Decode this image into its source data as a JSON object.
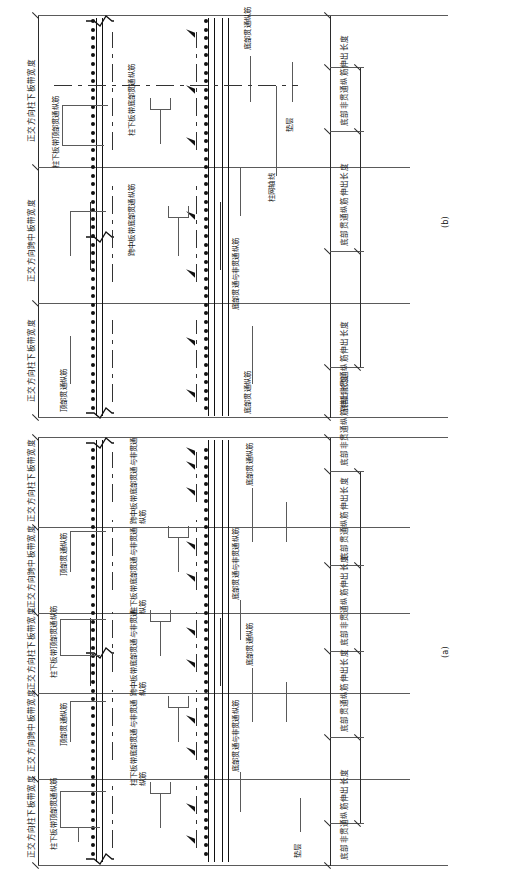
{
  "drawing": {
    "type": "structural-reinforcement-section",
    "discipline": "raft-foundation-slab-band-reinforcement",
    "orientation": "page-rotated-90-ccw",
    "figures": [
      {
        "id": "a",
        "tag": "(a)"
      },
      {
        "id": "b",
        "tag": "(b)"
      }
    ]
  },
  "labels": {
    "column_strip_width": "正交方向柱下板带宽度",
    "middle_strip_width": "正交方向跨中板带宽度",
    "column_strip_top_through_bars": "柱下板带顶部贯通纵筋",
    "column_strip_bottom_bars": "柱下板带底部贯通与非贯通纵筋",
    "middle_strip_bottom_bars": "跨中板带底部贯通与非贯通纵筋",
    "top_through_bars": "顶部贯通纵筋",
    "bottom_through_bars": "底部贯通纵筋",
    "bottom_through_and_non_through_bars": "底部贯通与非贯通纵筋",
    "bottom_non_through_extension_length": "底部非贯通纵筋伸出长度",
    "bottom_through_extension_length": "底部贯通纵筋伸出长度",
    "column_grid_axis": "柱网轴线",
    "cushion_layer": "垫层"
  },
  "figure_a": {
    "tag": "(a)",
    "dimension_chain_top": [
      "正交方向柱下板带宽度",
      "正交方向跨中板带宽度",
      "正交方向柱下板带宽度",
      "正交方向跨中板带宽度",
      "正交方向柱下板带宽度"
    ],
    "dimension_chain_bottom": [
      "底部非贯通纵筋伸出长度",
      "底部贯通纵筋伸出长度",
      "底部非贯通纵筋伸出长度",
      "底部贯通纵筋伸出长度",
      "底部非贯通纵筋伸出长度"
    ],
    "callouts": [
      "柱下板带顶部贯通纵筋",
      "柱下板带底部贯通与非贯通纵筋",
      "顶部贯通纵筋",
      "跨中板带底部贯通与非贯通纵筋",
      "底部贯通纵筋",
      "底部贯通与非贯通纵筋",
      "柱下板带顶部贯通纵筋",
      "柱下板带底部贯通与非贯通纵筋",
      "顶部贯通纵筋",
      "跨中板带底部贯通与非贯通纵筋",
      "底部贯通纵筋",
      "底部贯通与非贯通纵筋",
      "垫层"
    ]
  },
  "figure_b": {
    "tag": "(b)",
    "dimension_chain_top": [
      "正交方向柱下板带宽度",
      "正交方向跨中板带宽度",
      "正交方向柱下板带宽度"
    ],
    "dimension_chain_bottom": [
      "底部非贯通纵筋伸出长度",
      "底部贯通纵筋伸出长度",
      "底部非贯通纵筋伸出长度"
    ],
    "callouts": [
      "柱下板带顶部贯通纵筋",
      "柱下板带底部贯通纵筋",
      "顶部贯通纵筋",
      "跨中板带底部贯通纵筋",
      "底部贯通纵筋",
      "底部贯通与非贯通纵筋",
      "柱网轴线",
      "垫层"
    ]
  },
  "colors": {
    "line": "#2b2b2b",
    "heavy_line": "#111111",
    "rebar_dot": "#111111",
    "background": "#ffffff",
    "text": "#141414"
  }
}
